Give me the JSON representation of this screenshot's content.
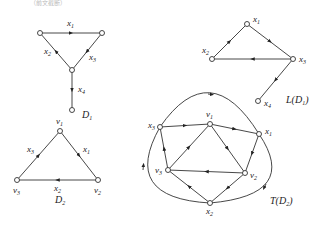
{
  "header_fragment": "（前文截断）",
  "graphs": {
    "D1": {
      "name": "D",
      "sub": "1",
      "edges": [
        {
          "label": "x",
          "sub": "1"
        },
        {
          "label": "x",
          "sub": "2"
        },
        {
          "label": "x",
          "sub": "3"
        },
        {
          "label": "x",
          "sub": "4"
        }
      ]
    },
    "LD1": {
      "name": "L(D",
      "sub": "1",
      "close": ")",
      "nodes": [
        {
          "label": "x",
          "sub": "1"
        },
        {
          "label": "x",
          "sub": "2"
        },
        {
          "label": "x",
          "sub": "3"
        },
        {
          "label": "x",
          "sub": "4"
        }
      ]
    },
    "D2": {
      "name": "D",
      "sub": "2",
      "nodes": [
        {
          "label": "v",
          "sub": "1"
        },
        {
          "label": "v",
          "sub": "2"
        },
        {
          "label": "v",
          "sub": "3"
        }
      ],
      "edges": [
        {
          "label": "x",
          "sub": "1"
        },
        {
          "label": "x",
          "sub": "2"
        },
        {
          "label": "x",
          "sub": "3"
        }
      ]
    },
    "TD2": {
      "name": "T(D",
      "sub": "2",
      "close": ")",
      "nodes": [
        {
          "label": "v",
          "sub": "1"
        },
        {
          "label": "v",
          "sub": "2"
        },
        {
          "label": "v",
          "sub": "3"
        },
        {
          "label": "x",
          "sub": "1"
        },
        {
          "label": "x",
          "sub": "2"
        },
        {
          "label": "x",
          "sub": "3"
        }
      ]
    }
  }
}
